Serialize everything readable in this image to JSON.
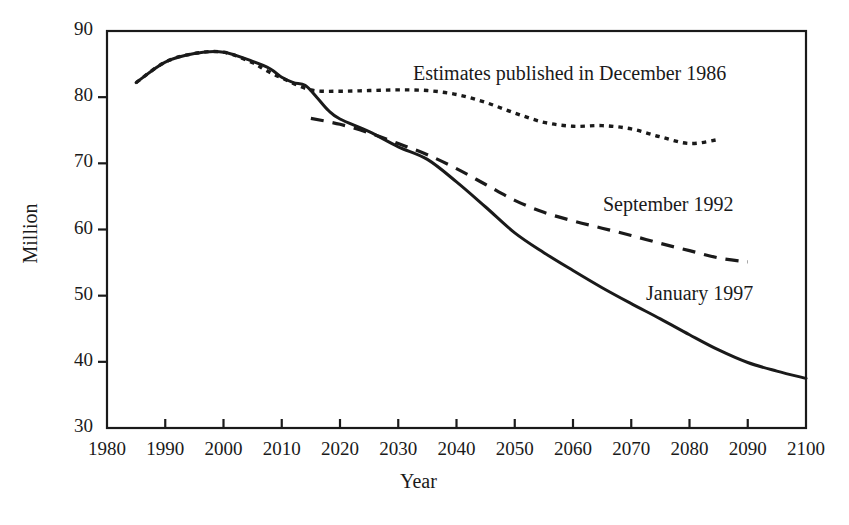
{
  "chart_data": {
    "type": "line",
    "title": "",
    "xlabel": "Year",
    "ylabel": "Million",
    "xlim": [
      1980,
      2100
    ],
    "ylim": [
      30,
      90
    ],
    "xticks": [
      1980,
      1990,
      2000,
      2010,
      2020,
      2030,
      2040,
      2050,
      2060,
      2070,
      2080,
      2090,
      2100
    ],
    "yticks": [
      30,
      40,
      50,
      60,
      70,
      80,
      90
    ],
    "grid": false,
    "legend_position": "inline-annotations",
    "series": [
      {
        "name": "Estimates published in December 1986",
        "style": "dotted",
        "color": "#1a1a1a",
        "x": [
          1985,
          1990,
          1995,
          2000,
          2005,
          2007,
          2010,
          2015,
          2020,
          2025,
          2030,
          2035,
          2040,
          2045,
          2050,
          2055,
          2060,
          2065,
          2070,
          2075,
          2080,
          2085
        ],
        "y": [
          82.2,
          85.3,
          86.6,
          86.8,
          85.2,
          84.2,
          82.9,
          81.1,
          80.9,
          81.0,
          81.1,
          81.0,
          80.4,
          79.2,
          77.6,
          76.2,
          75.6,
          75.7,
          75.2,
          74.0,
          73.0,
          73.6
        ]
      },
      {
        "name": "September 1992",
        "style": "dashed",
        "color": "#1a1a1a",
        "x": [
          2015,
          2020,
          2025,
          2030,
          2035,
          2040,
          2045,
          2050,
          2055,
          2060,
          2065,
          2070,
          2075,
          2080,
          2085,
          2090
        ],
        "y": [
          76.8,
          75.9,
          74.6,
          73.0,
          71.3,
          69.2,
          66.8,
          64.4,
          62.6,
          61.3,
          60.2,
          59.1,
          57.9,
          56.8,
          55.7,
          55.1
        ]
      },
      {
        "name": "January 1997",
        "style": "solid",
        "color": "#1a1a1a",
        "x": [
          1985,
          1990,
          1995,
          2000,
          2005,
          2008,
          2010,
          2012,
          2014,
          2016,
          2018,
          2020,
          2025,
          2030,
          2035,
          2040,
          2045,
          2050,
          2055,
          2060,
          2065,
          2070,
          2075,
          2080,
          2085,
          2090,
          2095,
          2100
        ],
        "y": [
          82.2,
          85.3,
          86.6,
          86.8,
          85.4,
          84.3,
          83.0,
          82.2,
          81.8,
          80.0,
          78.0,
          76.7,
          74.8,
          72.5,
          70.6,
          67.2,
          63.4,
          59.5,
          56.5,
          53.8,
          51.2,
          48.8,
          46.5,
          44.1,
          41.8,
          39.9,
          38.6,
          37.5
        ]
      }
    ],
    "annotations": [
      {
        "text": "Estimates published in December 1986",
        "x": 413,
        "y": 62
      },
      {
        "text": "September 1992",
        "x": 603,
        "y": 193
      },
      {
        "text": "January 1997",
        "x": 646,
        "y": 282
      }
    ]
  },
  "axis": {
    "ylabel": "Million",
    "xlabel": "Year",
    "yticks": [
      "90",
      "80",
      "70",
      "60",
      "50",
      "40",
      "30"
    ],
    "xticks": [
      "1980",
      "1990",
      "2000",
      "2010",
      "2020",
      "2030",
      "2040",
      "2050",
      "2060",
      "2070",
      "2080",
      "2090",
      "2100"
    ]
  },
  "style": {
    "line_color": "#1a1a1a",
    "frame_color": "#1a1a1a",
    "background": "#ffffff"
  }
}
